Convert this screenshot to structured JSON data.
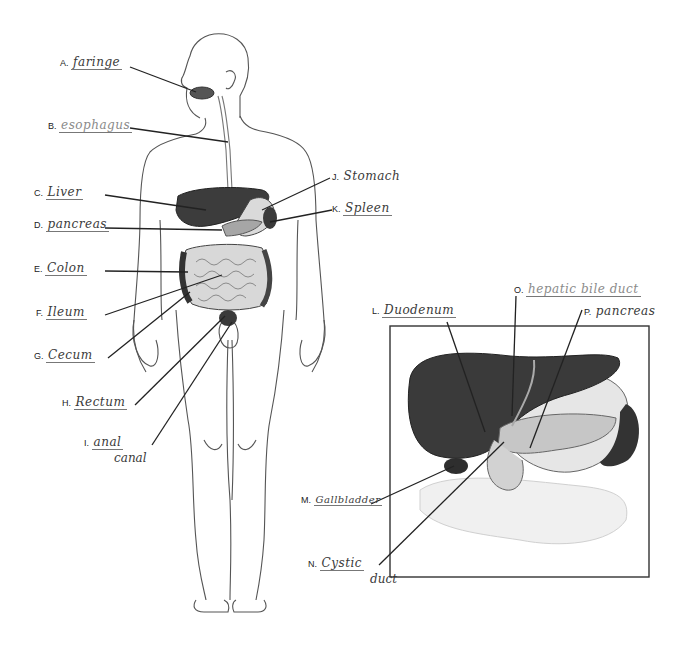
{
  "worksheet": {
    "title": "Digestive System Labeling",
    "body_labels": [
      {
        "letter": "A.",
        "answer": "Pharynx (written: faring)"
      },
      {
        "letter": "B.",
        "answer": "esophagus"
      },
      {
        "letter": "C.",
        "answer": "Liver"
      },
      {
        "letter": "D.",
        "answer": "pancreas"
      },
      {
        "letter": "E.",
        "answer": "Colon"
      },
      {
        "letter": "F.",
        "answer": "Ileum"
      },
      {
        "letter": "G.",
        "answer": "Cecum"
      },
      {
        "letter": "H.",
        "answer": "Rectum"
      },
      {
        "letter": "I.",
        "answer": "anal",
        "answer_line2": "canal"
      },
      {
        "letter": "J.",
        "answer": "Stomach"
      },
      {
        "letter": "K.",
        "answer": "Spleen"
      }
    ],
    "inset_labels": [
      {
        "letter": "L.",
        "answer": "Duodenum"
      },
      {
        "letter": "M.",
        "answer": "Gallbladder"
      },
      {
        "letter": "N.",
        "answer": "Cystic",
        "answer_line2": "duct"
      },
      {
        "letter": "O.",
        "answer": "hepatic bile duct"
      },
      {
        "letter": "P.",
        "answer": "pancreas"
      }
    ],
    "display": {
      "A": "faringe",
      "B": "esophagus",
      "C": "Liver",
      "D": "pancreas",
      "E": "Colon",
      "F": "Ileum",
      "G": "Cecum",
      "H": "Rectum",
      "I1": "anal",
      "I2": "canal",
      "J": "Stomach",
      "K": "Spleen",
      "L": "Duodenum",
      "M": "Gallbladder",
      "N1": "Cystic",
      "N2": "duct",
      "O": "hepatic bile duct",
      "P": "pancreas"
    },
    "colors": {
      "line": "#222222",
      "organ_dark": "#3a3a3a",
      "organ_mid": "#8f8f8f",
      "organ_light": "#cfcfcf",
      "outline": "#555555"
    }
  }
}
